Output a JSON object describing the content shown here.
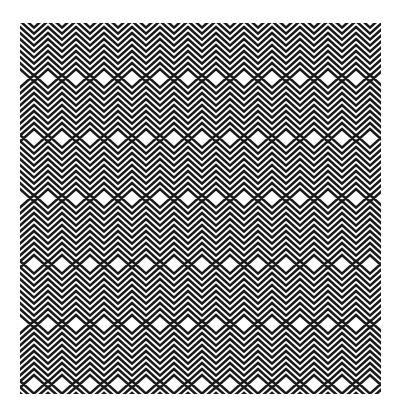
{
  "image": {
    "description": "Op-art black and white zigzag line pattern forming a square",
    "caption": "Zigzag op-art pattern",
    "colors": {
      "background": "#ffffff",
      "line": "#1a1a1a"
    },
    "pattern": {
      "left": 20,
      "top": 23,
      "width": 361,
      "height": 371,
      "stripe_pitch": 6,
      "stripe_width": 2.6,
      "zig_half_period": 14,
      "band_height": 62
    }
  }
}
